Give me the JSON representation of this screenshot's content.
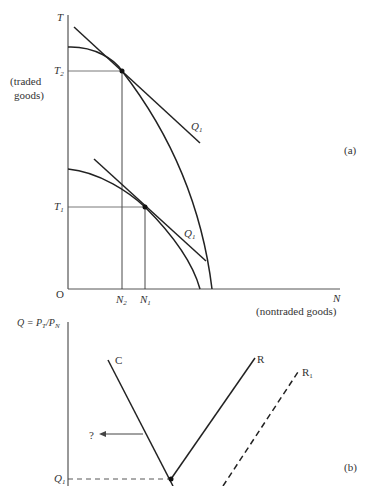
{
  "panel_a": {
    "tag": "(a)",
    "y_axis": {
      "symbol": "T",
      "label": "(traded",
      "label2": "goods)"
    },
    "x_axis": {
      "symbol": "N",
      "label": "(nontraded goods)"
    },
    "origin": "O",
    "ticks_y": {
      "t2": "T",
      "t2_sub": "2",
      "t1": "T",
      "t1_sub": "1"
    },
    "ticks_x": {
      "n2": "N",
      "n2_sub": "2",
      "n1": "N",
      "n1_sub": "1"
    },
    "tangent_upper": {
      "label": "Q",
      "sub": "1"
    },
    "tangent_lower": {
      "label": "Q",
      "sub": "1"
    }
  },
  "panel_b": {
    "tag": "(b)",
    "y_axis": {
      "label": "Q = P",
      "sub1": "T",
      "mid": "/P",
      "sub2": "N"
    },
    "curve_c": "C",
    "curve_r": "R",
    "curve_r1": {
      "label": "R",
      "sub": "1"
    },
    "arrow_label": "?",
    "q1": {
      "label": "Q",
      "sub": "1"
    }
  },
  "colors": {
    "line": "#222222",
    "guide": "#555555",
    "background": "#ffffff"
  }
}
